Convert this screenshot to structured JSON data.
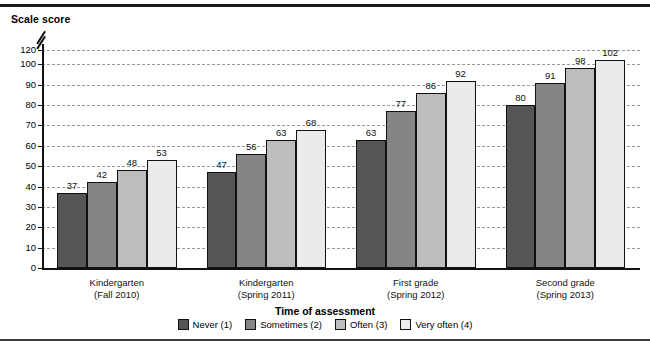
{
  "chart_data": {
    "type": "bar",
    "title": "",
    "ylabel": "Scale score",
    "xlabel": "Time of assessment",
    "categories": [
      "Kindergarten\n(Fall 2010)",
      "Kindergarten\n(Spring 2011)",
      "First grade\n(Spring 2012)",
      "Second grade\n(Spring 2013)"
    ],
    "category_lines": [
      [
        "Kindergarten",
        "(Fall 2010)"
      ],
      [
        "Kindergarten",
        "(Spring 2011)"
      ],
      [
        "First grade",
        "(Spring 2012)"
      ],
      [
        "Second grade",
        "(Spring 2013)"
      ]
    ],
    "series": [
      {
        "name": "Never (1)",
        "color": "#565656",
        "values": [
          37,
          47,
          63,
          80
        ]
      },
      {
        "name": "Sometimes (2)",
        "color": "#858585",
        "values": [
          42,
          56,
          77,
          91
        ]
      },
      {
        "name": "Often (3)",
        "color": "#bdbdbd",
        "values": [
          48,
          63,
          86,
          98
        ]
      },
      {
        "name": "Very often (4)",
        "color": "#ebebeb",
        "values": [
          53,
          68,
          92,
          102
        ]
      }
    ],
    "ylim": [
      0,
      120
    ],
    "yticks": [
      0,
      10,
      20,
      30,
      40,
      50,
      60,
      70,
      80,
      90,
      100,
      120
    ],
    "y_axis_break": {
      "between": [
        100,
        120
      ],
      "present": true
    },
    "grid": "horizontal-dashed",
    "legend_position": "bottom-center",
    "gridline_color": "#9a9a9a",
    "axis_color": "#111111"
  },
  "legend": {
    "items": [
      "Never (1)",
      "Sometimes (2)",
      "Often (3)",
      "Very often (4)"
    ]
  },
  "footnote": {
    "text": ""
  }
}
